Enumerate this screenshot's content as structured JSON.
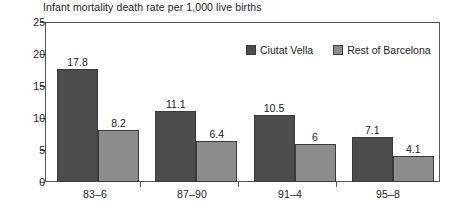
{
  "chart_data": {
    "type": "bar",
    "title": "Infant mortality death rate per 1,000 live births",
    "xlabel": "",
    "ylabel": "",
    "categories": [
      "83–6",
      "87–90",
      "91–4",
      "95–8"
    ],
    "series": [
      {
        "name": "Ciutat Vella",
        "color": "#4c4c4c",
        "values": [
          17.8,
          11.1,
          10.5,
          7.1
        ],
        "labels": [
          "17.8",
          "11.1",
          "10.5",
          "7.1"
        ]
      },
      {
        "name": "Rest of Barcelona",
        "color": "#8c8c8c",
        "values": [
          8.2,
          6.4,
          6,
          4.1
        ],
        "labels": [
          "8.2",
          "6.4",
          "6",
          "4.1"
        ]
      }
    ],
    "ylim": [
      0,
      25
    ],
    "yticks": [
      0,
      5,
      10,
      15,
      20,
      25
    ],
    "ytick_labels": [
      "0",
      "5",
      "10",
      "15",
      "20",
      "25"
    ],
    "grid": false,
    "legend_position": "inside-top-right"
  }
}
